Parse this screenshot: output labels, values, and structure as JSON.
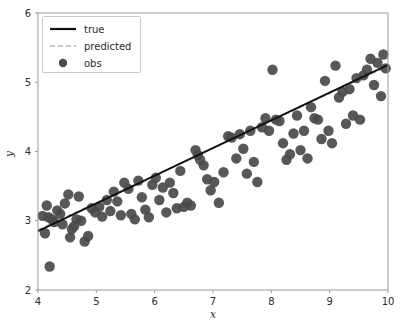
{
  "chart_data": {
    "type": "scatter",
    "title": "",
    "xlabel": "x",
    "ylabel": "y",
    "xlim": [
      4,
      10
    ],
    "ylim": [
      2,
      6
    ],
    "xticks": [
      4,
      5,
      6,
      7,
      8,
      9,
      10
    ],
    "yticks": [
      2,
      3,
      4,
      5,
      6
    ],
    "grid": false,
    "legend_position": "upper left",
    "legend": [
      {
        "label": "true",
        "style": "solid-line",
        "color": "#111111"
      },
      {
        "label": "predicted",
        "style": "dashed-line",
        "color": "#b4b4b4"
      },
      {
        "label": "obs",
        "style": "marker-dot",
        "color": "#4a4a4a"
      }
    ],
    "series": [
      {
        "name": "true",
        "type": "line",
        "style": "solid",
        "color": "#111111",
        "linewidth": 2.0,
        "x": [
          4.0,
          10.0
        ],
        "y": [
          2.85,
          5.25
        ]
      },
      {
        "name": "predicted",
        "type": "line",
        "style": "dashed",
        "color": "#b4b4b4",
        "linewidth": 1.2,
        "x": [
          4.0,
          10.0
        ],
        "y": [
          2.87,
          5.23
        ]
      },
      {
        "name": "obs",
        "type": "scatter",
        "color": "#4a4a4a",
        "marker_size": 5.2,
        "points": [
          [
            4.08,
            3.07
          ],
          [
            4.12,
            2.82
          ],
          [
            4.15,
            3.22
          ],
          [
            4.18,
            3.05
          ],
          [
            4.2,
            2.34
          ],
          [
            4.24,
            3.02
          ],
          [
            4.28,
            2.98
          ],
          [
            4.33,
            3.15
          ],
          [
            4.38,
            3.1
          ],
          [
            4.42,
            2.95
          ],
          [
            4.46,
            3.25
          ],
          [
            4.52,
            3.38
          ],
          [
            4.55,
            2.76
          ],
          [
            4.58,
            2.88
          ],
          [
            4.62,
            2.92
          ],
          [
            4.66,
            3.02
          ],
          [
            4.7,
            3.35
          ],
          [
            4.74,
            3.0
          ],
          [
            4.8,
            2.7
          ],
          [
            4.86,
            2.78
          ],
          [
            4.92,
            3.18
          ],
          [
            4.98,
            3.12
          ],
          [
            5.05,
            3.2
          ],
          [
            5.1,
            3.06
          ],
          [
            5.18,
            3.3
          ],
          [
            5.24,
            3.14
          ],
          [
            5.3,
            3.42
          ],
          [
            5.36,
            3.28
          ],
          [
            5.42,
            3.08
          ],
          [
            5.48,
            3.55
          ],
          [
            5.55,
            3.46
          ],
          [
            5.6,
            3.1
          ],
          [
            5.66,
            3.02
          ],
          [
            5.72,
            3.58
          ],
          [
            5.78,
            3.34
          ],
          [
            5.84,
            3.16
          ],
          [
            5.9,
            3.05
          ],
          [
            5.96,
            3.52
          ],
          [
            6.02,
            3.62
          ],
          [
            6.08,
            3.3
          ],
          [
            6.14,
            3.48
          ],
          [
            6.2,
            3.12
          ],
          [
            6.26,
            3.55
          ],
          [
            6.32,
            3.4
          ],
          [
            6.38,
            3.18
          ],
          [
            6.44,
            3.72
          ],
          [
            6.5,
            3.2
          ],
          [
            6.56,
            3.26
          ],
          [
            6.62,
            3.22
          ],
          [
            6.7,
            4.02
          ],
          [
            6.74,
            3.95
          ],
          [
            6.78,
            3.88
          ],
          [
            6.84,
            3.8
          ],
          [
            6.9,
            3.6
          ],
          [
            6.96,
            3.44
          ],
          [
            7.02,
            3.56
          ],
          [
            7.1,
            3.26
          ],
          [
            7.18,
            3.7
          ],
          [
            7.26,
            4.22
          ],
          [
            7.32,
            4.2
          ],
          [
            7.4,
            3.9
          ],
          [
            7.46,
            4.25
          ],
          [
            7.52,
            4.04
          ],
          [
            7.58,
            3.68
          ],
          [
            7.64,
            4.3
          ],
          [
            7.7,
            3.85
          ],
          [
            7.76,
            3.56
          ],
          [
            7.84,
            4.35
          ],
          [
            7.9,
            4.48
          ],
          [
            7.96,
            4.3
          ],
          [
            8.02,
            5.18
          ],
          [
            8.08,
            4.46
          ],
          [
            8.14,
            4.44
          ],
          [
            8.2,
            4.12
          ],
          [
            8.26,
            3.88
          ],
          [
            8.32,
            3.96
          ],
          [
            8.38,
            4.26
          ],
          [
            8.44,
            4.52
          ],
          [
            8.5,
            4.02
          ],
          [
            8.56,
            4.3
          ],
          [
            8.62,
            3.9
          ],
          [
            8.68,
            4.64
          ],
          [
            8.74,
            4.48
          ],
          [
            8.8,
            4.46
          ],
          [
            8.86,
            4.18
          ],
          [
            8.92,
            5.02
          ],
          [
            8.98,
            4.3
          ],
          [
            9.04,
            4.12
          ],
          [
            9.1,
            5.24
          ],
          [
            9.16,
            4.78
          ],
          [
            9.22,
            4.86
          ],
          [
            9.28,
            4.4
          ],
          [
            9.34,
            4.9
          ],
          [
            9.4,
            4.52
          ],
          [
            9.46,
            5.06
          ],
          [
            9.52,
            4.46
          ],
          [
            9.58,
            5.1
          ],
          [
            9.64,
            5.18
          ],
          [
            9.7,
            5.34
          ],
          [
            9.76,
            4.96
          ],
          [
            9.82,
            5.28
          ],
          [
            9.88,
            4.8
          ],
          [
            9.92,
            5.4
          ],
          [
            9.96,
            5.2
          ]
        ]
      }
    ]
  },
  "axes": {
    "x_title": "x",
    "y_title": "y"
  }
}
